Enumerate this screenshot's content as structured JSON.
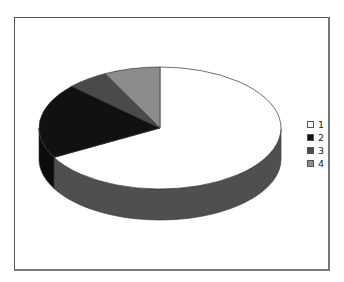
{
  "chart_data": {
    "type": "pie",
    "style": "3d",
    "title": "",
    "categories": [
      "1",
      "2",
      "3",
      "4"
    ],
    "values": [
      67,
      20,
      5.5,
      7.5
    ],
    "colors": [
      "#ffffff",
      "#111111",
      "#4a4a4a",
      "#8c8c8c"
    ],
    "side_colors": [
      "#4f4f4f",
      "#0c0c0c",
      "#333333",
      "#666666"
    ],
    "legend_position": "right",
    "start_angle_deg": 90,
    "direction": "clockwise"
  },
  "legend": {
    "items": [
      {
        "label": "1",
        "color": "#ffffff"
      },
      {
        "label": "2",
        "color": "#111111"
      },
      {
        "label": "3",
        "color": "#4a4a4a"
      },
      {
        "label": "4",
        "color": "#8c8c8c"
      }
    ]
  }
}
